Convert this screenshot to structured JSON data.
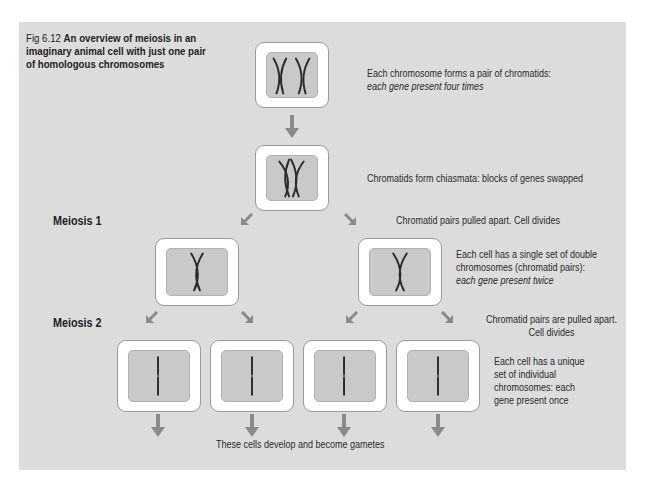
{
  "caption": {
    "figure_number": "Fig 6.12",
    "title": "An overview of meiosis in an imaginary animal cell with just one pair of homologous chromosomes"
  },
  "stages": {
    "meiosis1": "Meiosis 1",
    "meiosis2": "Meiosis 2"
  },
  "annotations": {
    "step1_line1": "Each chromosome forms a pair of chromatids:",
    "step1_line2": "each gene present four times",
    "step2": "Chromatids form chiasmata: blocks of genes swapped",
    "step3": "Chromatid pairs pulled apart.  Cell divides",
    "step4_line1": "Each cell has a single set of double",
    "step4_line2": "chromosomes (chromatid pairs):",
    "step4_line3": "each gene present twice",
    "step5_line1": "Chromatid pairs are pulled apart.",
    "step5_line2": "Cell divides",
    "step6_line1": "Each cell has a unique",
    "step6_line2": "set of individual",
    "step6_line3": "chromosomes: each",
    "step6_line4": "gene present once",
    "final": "These cells develop and become gametes"
  },
  "cells": [
    {
      "id": "parent-cell",
      "content": "two chromosomes, each a pair of chromatids"
    },
    {
      "id": "chiasmata-cell",
      "content": "homologous chromatids crossing over"
    },
    {
      "id": "meiosis1-daughter-left",
      "content": "single chromatid pair"
    },
    {
      "id": "meiosis1-daughter-right",
      "content": "single chromatid pair"
    },
    {
      "id": "gamete-cell-1",
      "content": "single chromosome"
    },
    {
      "id": "gamete-cell-2",
      "content": "single chromosome"
    },
    {
      "id": "gamete-cell-3",
      "content": "single chromosome"
    },
    {
      "id": "gamete-cell-4",
      "content": "single chromosome"
    }
  ],
  "colors": {
    "panel_background": "#dcdcdc",
    "cell_inner": "#c9c9c9",
    "arrow": "#8a8a8a",
    "chromosome": "#2b2b2b"
  }
}
